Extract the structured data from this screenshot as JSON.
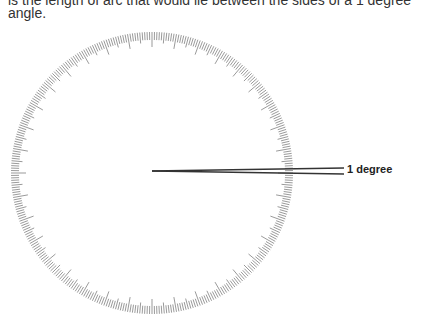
{
  "text": {
    "line1": "is the length of arc that would lie between the sides of a 1 degree",
    "line2": "angle."
  },
  "diagram": {
    "circle": {
      "cx": 152,
      "cy": 173,
      "r_outer": 141,
      "r_inner": 128,
      "tick_count": 360,
      "tick_color": "#555"
    },
    "angle_lines": {
      "origin": [
        152,
        171
      ],
      "end_upper": [
        344,
        168
      ],
      "end_lower": [
        344,
        174
      ],
      "color": "#333"
    },
    "label": "1 degree"
  }
}
